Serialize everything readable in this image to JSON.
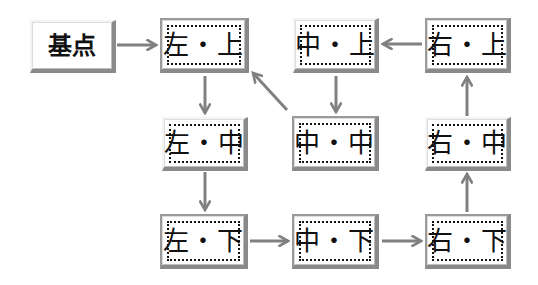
{
  "colors": {
    "arrow": "#808080",
    "box_shadow": "#8a8a8a",
    "text": "#111111"
  },
  "nodes": {
    "base": {
      "label": "基点"
    },
    "left_top": {
      "label": "左・上"
    },
    "center_top": {
      "label": "中・上"
    },
    "right_top": {
      "label": "右・上"
    },
    "left_middle": {
      "label": "左・中"
    },
    "center_middle": {
      "label": "中・中"
    },
    "right_middle": {
      "label": "右・中"
    },
    "left_bottom": {
      "label": "左・下"
    },
    "center_bottom": {
      "label": "中・下"
    },
    "right_bottom": {
      "label": "右・下"
    }
  },
  "edges": [
    {
      "from": "基点",
      "to": "左・上"
    },
    {
      "from": "左・上",
      "to": "左・中"
    },
    {
      "from": "左・中",
      "to": "左・下"
    },
    {
      "from": "左・下",
      "to": "中・下"
    },
    {
      "from": "中・下",
      "to": "右・下"
    },
    {
      "from": "右・下",
      "to": "右・中"
    },
    {
      "from": "右・中",
      "to": "右・上"
    },
    {
      "from": "右・上",
      "to": "中・上"
    },
    {
      "from": "中・上",
      "to": "中・中"
    },
    {
      "from": "中・中",
      "to": "左・上"
    }
  ]
}
